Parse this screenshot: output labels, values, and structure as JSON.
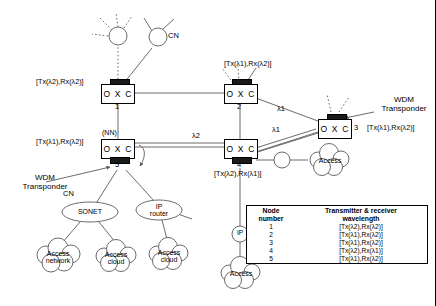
{
  "diagram": {
    "line_color": "#6b6b6b",
    "transponder_color": "#1a1a1a"
  },
  "nodes": {
    "oxc": [
      {
        "id": "oxc1",
        "label": "O X C",
        "number": "1",
        "tx_rx": "[Tx(λ2),Rx(λ2)]"
      },
      {
        "id": "oxc2",
        "label": "O X C",
        "number": "2",
        "tx_rx": "[Tx(λ1),Rx(λ2)]"
      },
      {
        "id": "oxc3",
        "label": "O X C",
        "number": "3",
        "tx_rx": "[Tx(λ1),Rx(λ2)]"
      },
      {
        "id": "oxc4",
        "label": "O X C",
        "number": "4",
        "tx_rx": "[Tx(λ2),Rx(λ1)]"
      },
      {
        "id": "oxc5",
        "label": "O X C",
        "number": "5",
        "tx_rx": "[Tx(λ1),Rx(λ2)]"
      }
    ],
    "client_nodes": [
      {
        "id": "cn-top-left",
        "label": ""
      },
      {
        "id": "cn-top-right",
        "label": "CN"
      },
      {
        "id": "cn-oxc3-top",
        "label": ""
      },
      {
        "id": "plain-circle-oxc4",
        "label": ""
      },
      {
        "id": "ip-cn",
        "label": "IP"
      }
    ],
    "ellipses": [
      {
        "id": "sonet",
        "label": "SONET"
      },
      {
        "id": "ip-router",
        "label": "IP\nrouter"
      }
    ],
    "clouds": [
      {
        "id": "access-network",
        "label": "Access\nnetwork"
      },
      {
        "id": "access-cloud-1",
        "label": "Access\ncloud"
      },
      {
        "id": "access-cloud-2",
        "label": "Access\ncloud"
      },
      {
        "id": "access-right",
        "label": "Access"
      },
      {
        "id": "access-bottom",
        "label": "Access"
      }
    ]
  },
  "annotations": {
    "wdm_transponder_left": "WDM\nTransponder",
    "wdm_transponder_right": "WDM\nTransponder",
    "cn_top": "CN",
    "cn_sonet": "CN",
    "cn_ip": "CN",
    "nn": "(NN)",
    "lambda1": "λ1",
    "lambda2_top": "λ2",
    "lambda2_left": "λ2"
  },
  "table": {
    "headers": [
      "Node\nnumber",
      "Transmitter & receiver\nwavelength"
    ],
    "header_col1_line1": "Node",
    "header_col1_line2": "number",
    "header_col2_line1": "Transmitter & receiver",
    "header_col2_line2": "wavelength",
    "rows": [
      {
        "number": "1",
        "wavelength": "[Tx(λ2),Rx(λ2)]"
      },
      {
        "number": "2",
        "wavelength": "[Tx(λ1),Rx(λ2)]"
      },
      {
        "number": "3",
        "wavelength": "[Tx(λ1),Rx(λ2)]"
      },
      {
        "number": "4",
        "wavelength": "[Tx(λ2),Rx(λ1)]"
      },
      {
        "number": "5",
        "wavelength": "[Tx(λ1),Rx(λ2)]"
      }
    ]
  }
}
